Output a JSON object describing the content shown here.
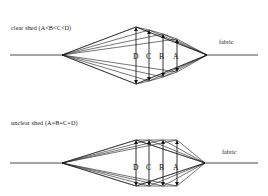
{
  "page": {
    "width": 268,
    "height": 196,
    "background": "#ffffff",
    "line_color": "#1a1a1a"
  },
  "diagrams": [
    {
      "id": "clear-shed",
      "caption": "clear shed (A<B<C<D)",
      "fabric_label": "fabric",
      "relation": "A<B<C<D",
      "shed_openings": [
        {
          "letter": "D",
          "x": 136,
          "label_x": 133,
          "label_y": 52,
          "top_y": 27,
          "bottom_y": 84,
          "height": 57
        },
        {
          "letter": "C",
          "x": 149,
          "label_x": 146,
          "label_y": 52,
          "top_y": 30,
          "bottom_y": 81,
          "height": 51
        },
        {
          "letter": "B",
          "x": 163,
          "label_x": 159,
          "label_y": 52,
          "top_y": 34,
          "bottom_y": 77,
          "height": 43
        },
        {
          "letter": "A",
          "x": 177,
          "label_x": 173,
          "label_y": 52,
          "top_y": 39,
          "bottom_y": 72,
          "height": 33
        }
      ],
      "geometry": {
        "left_vertex_x": 62,
        "left_vertex_y": 55,
        "right_vertex_x": 207,
        "right_vertex_y": 55,
        "warp_left_end_x": 10,
        "warp_right_end_x": 258,
        "apex_top_y": 27,
        "apex_bottom_y": 84,
        "apex_x": 136
      }
    },
    {
      "id": "unclear-shed",
      "caption": "unclear shed (A=B=C=D)",
      "fabric_label": "fabric",
      "relation": "A=B=C=D",
      "shed_openings": [
        {
          "letter": "D",
          "x": 136,
          "label_x": 133,
          "label_y": 163,
          "top_y": 140,
          "bottom_y": 186,
          "height": 46
        },
        {
          "letter": "C",
          "x": 149,
          "label_x": 146,
          "label_y": 163,
          "top_y": 140,
          "bottom_y": 186,
          "height": 46
        },
        {
          "letter": "B",
          "x": 163,
          "label_x": 159,
          "label_y": 163,
          "top_y": 140,
          "bottom_y": 186,
          "height": 46
        },
        {
          "letter": "A",
          "x": 177,
          "label_x": 173,
          "label_y": 163,
          "top_y": 140,
          "bottom_y": 186,
          "height": 46
        }
      ],
      "geometry": {
        "left_vertex_x": 62,
        "left_vertex_y": 163,
        "right_vertex_x": 205,
        "right_vertex_y": 163,
        "warp_left_end_x": 10,
        "warp_right_end_x": 258,
        "apex_top_y": 140,
        "apex_bottom_y": 186,
        "apex_x": 136
      }
    }
  ]
}
